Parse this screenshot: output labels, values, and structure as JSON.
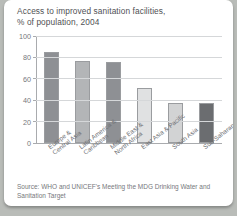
{
  "card": {
    "title_line1": "Access to improved sanitation facilities,",
    "title_line2": "% of population, 2004",
    "source_line1": "Source: WHO and UNICEF's Meeting the MDG Drinking Water and",
    "source_line2": "Sanitation Target"
  },
  "chart_data": {
    "type": "bar",
    "title": "Access to improved sanitation facilities, % of population, 2004",
    "xlabel": "",
    "ylabel": "% of population",
    "ylim": [
      0,
      100
    ],
    "yticks": [
      "0",
      "20",
      "40",
      "60",
      "80",
      "100"
    ],
    "grid": true,
    "legend": "none",
    "categories": [
      "Europe & Central Asia",
      "Latin America & Caribbean",
      "Middle East & North Africa",
      "East Asia & Pacific",
      "South Asia",
      "Sub-Saharan Africa"
    ],
    "category_lines": [
      [
        "Europe &",
        "Central Asia"
      ],
      [
        "Latin America &",
        "Caribbean"
      ],
      [
        "Middle East &",
        "North Africa"
      ],
      [
        "East Asia & Pacific",
        ""
      ],
      [
        "South Asia",
        ""
      ],
      [
        "Sub-Saharan Africa",
        ""
      ]
    ],
    "values": [
      85,
      77,
      76,
      51,
      37,
      37
    ],
    "bar_colors": [
      "#8e9094",
      "#b3b5b7",
      "#8e9094",
      "#e0e1e2",
      "#d2d3d4",
      "#6b6d70"
    ],
    "bar_border_color": "#9a9c9f"
  },
  "colors": {
    "page_background": "#b9bcb8",
    "card_background": "#ffffff",
    "axis": "#a9abae",
    "gridline": "#d5d7d9",
    "text": "#4f5054",
    "muted_text": "#76787c"
  }
}
